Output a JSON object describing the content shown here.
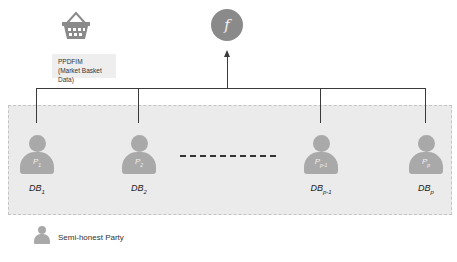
{
  "diagram": {
    "function_node": {
      "symbol": "f",
      "color": "#8a8a8a"
    },
    "basket": {
      "icon": "shopping-basket-icon",
      "label_line1": "PPDFIM",
      "label_line2": "(Market Basket Data)"
    },
    "parties": [
      {
        "person_label": "P",
        "person_sub": "1",
        "db_label": "DB",
        "db_sub": "1"
      },
      {
        "person_label": "P",
        "person_sub": "2",
        "db_label": "DB",
        "db_sub": "2"
      },
      {
        "person_label": "P",
        "person_sub": "p-1",
        "db_label": "DB",
        "db_sub": "p-1"
      },
      {
        "person_label": "P",
        "person_sub": "p",
        "db_label": "DB",
        "db_sub": "p"
      }
    ],
    "ellipsis": "- - - - - - - -",
    "legend": {
      "icon": "person-icon",
      "label": "Semi-honest Party"
    },
    "colors": {
      "region_bg": "#ebebeb",
      "person": "#a9a9a9",
      "line": "#3a3a3a"
    }
  }
}
